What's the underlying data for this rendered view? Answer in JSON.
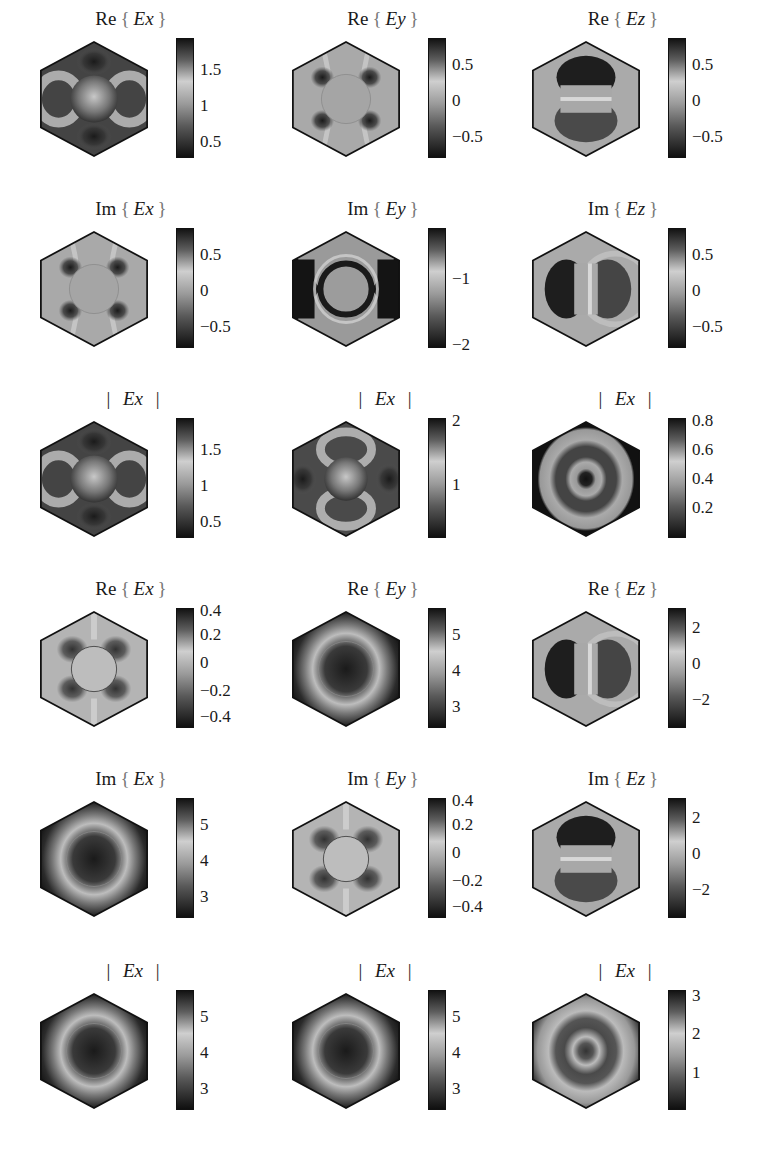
{
  "figure": {
    "layout": {
      "rows": 6,
      "cols": 3
    },
    "panels": [
      {
        "id": "r1c1",
        "x": 38,
        "y": 0,
        "prefix": "Re",
        "field": "Ex",
        "suffix": "",
        "ticks": [
          {
            "v": "1.5",
            "p": 0.26
          },
          {
            "v": "1",
            "p": 0.56
          },
          {
            "v": "0.5",
            "p": 0.86
          }
        ],
        "pattern": "ex-mag"
      },
      {
        "id": "r1c2",
        "x": 290,
        "y": 0,
        "prefix": "Re",
        "field": "Ey",
        "suffix": "",
        "ticks": [
          {
            "v": "0.5",
            "p": 0.22
          },
          {
            "v": "0",
            "p": 0.52
          },
          {
            "v": "−0.5",
            "p": 0.82
          }
        ],
        "pattern": "quad-dipole"
      },
      {
        "id": "r1c3",
        "x": 530,
        "y": 0,
        "prefix": "Re",
        "field": "Ez",
        "suffix": "",
        "ticks": [
          {
            "v": "0.5",
            "p": 0.22
          },
          {
            "v": "0",
            "p": 0.52
          },
          {
            "v": "−0.5",
            "p": 0.82
          }
        ],
        "pattern": "ez-vertical"
      },
      {
        "id": "r2c1",
        "x": 38,
        "y": 190,
        "prefix": "Im",
        "field": "Ex",
        "suffix": "",
        "ticks": [
          {
            "v": "0.5",
            "p": 0.22
          },
          {
            "v": "0",
            "p": 0.52
          },
          {
            "v": "−0.5",
            "p": 0.82
          }
        ],
        "pattern": "quad-dipole"
      },
      {
        "id": "r2c2",
        "x": 290,
        "y": 190,
        "prefix": "Im",
        "field": "Ey",
        "suffix": "",
        "ticks": [
          {
            "v": "−1",
            "p": 0.42
          },
          {
            "v": "−2",
            "p": 0.97
          }
        ],
        "pattern": "ring-dark"
      },
      {
        "id": "r2c3",
        "x": 530,
        "y": 190,
        "prefix": "Im",
        "field": "Ez",
        "suffix": "",
        "ticks": [
          {
            "v": "0.5",
            "p": 0.22
          },
          {
            "v": "0",
            "p": 0.52
          },
          {
            "v": "−0.5",
            "p": 0.82
          }
        ],
        "pattern": "ez-horizontal"
      },
      {
        "id": "r3c1",
        "x": 38,
        "y": 380,
        "prefix": "|",
        "field": "Ex",
        "suffix": "|",
        "ticks": [
          {
            "v": "1.5",
            "p": 0.26
          },
          {
            "v": "1",
            "p": 0.56
          },
          {
            "v": "0.5",
            "p": 0.86
          }
        ],
        "pattern": "ex-mag"
      },
      {
        "id": "r3c2",
        "x": 290,
        "y": 380,
        "prefix": "|",
        "field": "Ex",
        "suffix": "|",
        "ticks": [
          {
            "v": "2",
            "p": 0.02
          },
          {
            "v": "1",
            "p": 0.55
          }
        ],
        "pattern": "ex-mag-rot"
      },
      {
        "id": "r3c3",
        "x": 530,
        "y": 380,
        "prefix": "|",
        "field": "Ex",
        "suffix": "|",
        "ticks": [
          {
            "v": "0.8",
            "p": 0.02
          },
          {
            "v": "0.6",
            "p": 0.26
          },
          {
            "v": "0.4",
            "p": 0.5
          },
          {
            "v": "0.2",
            "p": 0.74
          }
        ],
        "pattern": "rings-dark-edge"
      },
      {
        "id": "r4c1",
        "x": 38,
        "y": 570,
        "prefix": "Re",
        "field": "Ex",
        "suffix": "",
        "ticks": [
          {
            "v": "0.4",
            "p": 0.02
          },
          {
            "v": "0.2",
            "p": 0.22
          },
          {
            "v": "0",
            "p": 0.45
          },
          {
            "v": "−0.2",
            "p": 0.68
          },
          {
            "v": "−0.4",
            "p": 0.9
          }
        ],
        "pattern": "quad-small"
      },
      {
        "id": "r4c2",
        "x": 290,
        "y": 570,
        "prefix": "Re",
        "field": "Ey",
        "suffix": "",
        "ticks": [
          {
            "v": "5",
            "p": 0.22
          },
          {
            "v": "4",
            "p": 0.52
          },
          {
            "v": "3",
            "p": 0.82
          }
        ],
        "pattern": "halo"
      },
      {
        "id": "r4c3",
        "x": 530,
        "y": 570,
        "prefix": "Re",
        "field": "Ez",
        "suffix": "",
        "ticks": [
          {
            "v": "2",
            "p": 0.16
          },
          {
            "v": "0",
            "p": 0.46
          },
          {
            "v": "−2",
            "p": 0.76
          }
        ],
        "pattern": "ez-horizontal"
      },
      {
        "id": "r5c1",
        "x": 38,
        "y": 760,
        "prefix": "Im",
        "field": "Ex",
        "suffix": "",
        "ticks": [
          {
            "v": "5",
            "p": 0.22
          },
          {
            "v": "4",
            "p": 0.52
          },
          {
            "v": "3",
            "p": 0.82
          }
        ],
        "pattern": "halo"
      },
      {
        "id": "r5c2",
        "x": 290,
        "y": 760,
        "prefix": "Im",
        "field": "Ey",
        "suffix": "",
        "ticks": [
          {
            "v": "0.4",
            "p": 0.02
          },
          {
            "v": "0.2",
            "p": 0.22
          },
          {
            "v": "0",
            "p": 0.45
          },
          {
            "v": "−0.2",
            "p": 0.68
          },
          {
            "v": "−0.4",
            "p": 0.9
          }
        ],
        "pattern": "quad-small"
      },
      {
        "id": "r5c3",
        "x": 530,
        "y": 760,
        "prefix": "Im",
        "field": "Ez",
        "suffix": "",
        "ticks": [
          {
            "v": "2",
            "p": 0.16
          },
          {
            "v": "0",
            "p": 0.46
          },
          {
            "v": "−2",
            "p": 0.76
          }
        ],
        "pattern": "ez-vertical"
      },
      {
        "id": "r6c1",
        "x": 38,
        "y": 952,
        "prefix": "|",
        "field": "Ex",
        "suffix": "|",
        "ticks": [
          {
            "v": "5",
            "p": 0.22
          },
          {
            "v": "4",
            "p": 0.52
          },
          {
            "v": "3",
            "p": 0.82
          }
        ],
        "pattern": "halo"
      },
      {
        "id": "r6c2",
        "x": 290,
        "y": 952,
        "prefix": "|",
        "field": "Ex",
        "suffix": "|",
        "ticks": [
          {
            "v": "5",
            "p": 0.22
          },
          {
            "v": "4",
            "p": 0.52
          },
          {
            "v": "3",
            "p": 0.82
          }
        ],
        "pattern": "halo"
      },
      {
        "id": "r6c3",
        "x": 530,
        "y": 952,
        "prefix": "|",
        "field": "Ex",
        "suffix": "|",
        "ticks": [
          {
            "v": "3",
            "p": 0.04
          },
          {
            "v": "2",
            "p": 0.36
          },
          {
            "v": "1",
            "p": 0.68
          }
        ],
        "pattern": "rings"
      }
    ]
  },
  "chart_data": {
    "type": "heatmap",
    "title": "",
    "grid": {
      "rows": 6,
      "cols": 3
    },
    "panels": [
      {
        "row": 1,
        "col": 1,
        "title": "Re { Ex }",
        "colorbar_ticks": [
          1.5,
          1,
          0.5
        ]
      },
      {
        "row": 1,
        "col": 2,
        "title": "Re { Ey }",
        "colorbar_ticks": [
          0.5,
          0,
          -0.5
        ]
      },
      {
        "row": 1,
        "col": 3,
        "title": "Re { Ez }",
        "colorbar_ticks": [
          0.5,
          0,
          -0.5
        ]
      },
      {
        "row": 2,
        "col": 1,
        "title": "Im { Ex }",
        "colorbar_ticks": [
          0.5,
          0,
          -0.5
        ]
      },
      {
        "row": 2,
        "col": 2,
        "title": "Im { Ey }",
        "colorbar_ticks": [
          -1,
          -2
        ]
      },
      {
        "row": 2,
        "col": 3,
        "title": "Im { Ez }",
        "colorbar_ticks": [
          0.5,
          0,
          -0.5
        ]
      },
      {
        "row": 3,
        "col": 1,
        "title": "| Ex |",
        "colorbar_ticks": [
          1.5,
          1,
          0.5
        ]
      },
      {
        "row": 3,
        "col": 2,
        "title": "| Ex |",
        "colorbar_ticks": [
          2,
          1
        ]
      },
      {
        "row": 3,
        "col": 3,
        "title": "| Ex |",
        "colorbar_ticks": [
          0.8,
          0.6,
          0.4,
          0.2
        ]
      },
      {
        "row": 4,
        "col": 1,
        "title": "Re { Ex }",
        "colorbar_ticks": [
          0.4,
          0.2,
          0,
          -0.2,
          -0.4
        ]
      },
      {
        "row": 4,
        "col": 2,
        "title": "Re { Ey }",
        "colorbar_ticks": [
          5,
          4,
          3
        ]
      },
      {
        "row": 4,
        "col": 3,
        "title": "Re { Ez }",
        "colorbar_ticks": [
          2,
          0,
          -2
        ]
      },
      {
        "row": 5,
        "col": 1,
        "title": "Im { Ex }",
        "colorbar_ticks": [
          5,
          4,
          3
        ]
      },
      {
        "row": 5,
        "col": 2,
        "title": "Im { Ey }",
        "colorbar_ticks": [
          0.4,
          0.2,
          0,
          -0.2,
          -0.4
        ]
      },
      {
        "row": 5,
        "col": 3,
        "title": "Im { Ez }",
        "colorbar_ticks": [
          2,
          0,
          -2
        ]
      },
      {
        "row": 6,
        "col": 1,
        "title": "| Ex |",
        "colorbar_ticks": [
          5,
          4,
          3
        ]
      },
      {
        "row": 6,
        "col": 2,
        "title": "| Ex |",
        "colorbar_ticks": [
          5,
          4,
          3
        ]
      },
      {
        "row": 6,
        "col": 3,
        "title": "| Ex |",
        "colorbar_ticks": [
          3,
          2,
          1
        ]
      }
    ],
    "colormap": "grayscale (dark = high at top of bar, dark = low at bottom)",
    "domain_shape": "hexagon"
  }
}
